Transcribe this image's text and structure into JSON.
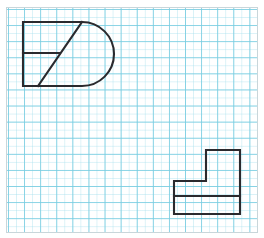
{
  "worksheet": {
    "title": "Engineering drawing grid worksheet",
    "background_color": "#ffffff",
    "grid": {
      "major_color": "#78cde1",
      "minor_color": "#aae1ee",
      "frame_color": "#c9d6da",
      "major_spacing_px": 16,
      "minor_spacing_px": 8,
      "frame": {
        "x": 6,
        "y": 7,
        "width": 252,
        "height": 226
      }
    },
    "ink_color": "#2a2a2e",
    "line_width_px": 2
  },
  "figures": [
    {
      "id": "d-shape",
      "name": "d-shape-figure",
      "description": "D-shaped outline with flat left side, semicircular right end, a horizontal interior divider and a diagonal interior line",
      "bounds": {
        "x": 23,
        "y": 22,
        "width": 95,
        "height": 64
      },
      "path": "M 23 22 L 82 22 A 32 32 0 0 1 82 86 L 23 86 Z",
      "interior_lines": [
        {
          "id": "horizontal-divider",
          "name": "horizontal-divider-line",
          "x1": 23,
          "y1": 53,
          "x2": 60,
          "y2": 53
        },
        {
          "id": "diagonal",
          "name": "diagonal-line",
          "x1": 38,
          "y1": 86,
          "x2": 82,
          "y2": 22
        }
      ]
    },
    {
      "id": "l-shape",
      "name": "l-shape-figure",
      "description": "Stepped L-shaped outline with a raised block on the right and a horizontal interior divider near the base",
      "bounds": {
        "x": 174,
        "y": 150,
        "width": 66,
        "height": 64
      },
      "path": "M 174 181 L 206 181 L 206 150 L 240 150 L 240 214 L 174 214 Z",
      "interior_lines": [
        {
          "id": "base-divider",
          "name": "base-divider-line",
          "x1": 174,
          "y1": 196,
          "x2": 240,
          "y2": 196
        }
      ]
    }
  ]
}
